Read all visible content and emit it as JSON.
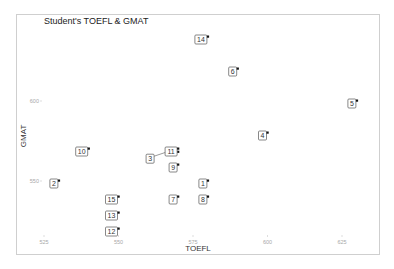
{
  "chart_data": {
    "type": "scatter",
    "title": "Student's TOEFL & GMAT",
    "xlabel": "TOEFL",
    "ylabel": "GMAT",
    "xlim": [
      519,
      641
    ],
    "ylim": [
      505,
      650
    ],
    "x_ticks": [
      525,
      550,
      575,
      600,
      625
    ],
    "y_ticks": [
      550,
      600
    ],
    "grid": false,
    "legend": null,
    "points": [
      {
        "label": "1",
        "x": 580,
        "y": 550
      },
      {
        "label": "2",
        "x": 530,
        "y": 550
      },
      {
        "label": "3",
        "x": 570,
        "y": 568
      },
      {
        "label": "4",
        "x": 600,
        "y": 580
      },
      {
        "label": "5",
        "x": 630,
        "y": 600
      },
      {
        "label": "6",
        "x": 590,
        "y": 620
      },
      {
        "label": "7",
        "x": 570,
        "y": 540
      },
      {
        "label": "8",
        "x": 580,
        "y": 540
      },
      {
        "label": "9",
        "x": 570,
        "y": 560
      },
      {
        "label": "10",
        "x": 540,
        "y": 570
      },
      {
        "label": "11",
        "x": 570,
        "y": 570
      },
      {
        "label": "12",
        "x": 550,
        "y": 520
      },
      {
        "label": "13",
        "x": 550,
        "y": 530
      },
      {
        "label": "14",
        "x": 580,
        "y": 640
      },
      {
        "label": "15",
        "x": 550,
        "y": 540
      }
    ]
  }
}
